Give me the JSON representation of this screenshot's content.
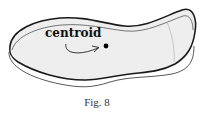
{
  "figure": {
    "label": "centroid",
    "caption": "Fig. 8",
    "colors": {
      "fill": "#eeeeee",
      "outline": "#222222",
      "thin_outline": "#555555",
      "dot": "#000000"
    }
  }
}
